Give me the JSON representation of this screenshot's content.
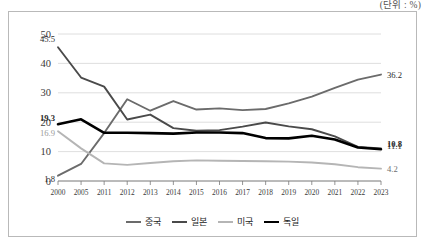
{
  "unit_note": "(단위 : %)",
  "legend": {
    "position": "bottom-center",
    "items": [
      {
        "label": "중국",
        "color": "#6b6b6b",
        "width": 2.2
      },
      {
        "label": "일본",
        "color": "#4a4a4a",
        "width": 2.2
      },
      {
        "label": "미국",
        "color": "#b5b5b5",
        "width": 2.2
      },
      {
        "label": "독일",
        "color": "#000000",
        "width": 2.8
      }
    ]
  },
  "chart_data": {
    "type": "line",
    "title": "",
    "subtitle": "",
    "xlabel": "",
    "ylabel": "",
    "unit": "%",
    "grid": true,
    "legend_position": "bottom-center",
    "ylim": [
      0,
      50
    ],
    "yticks": [
      "0",
      "10",
      "20",
      "30",
      "40",
      "50"
    ],
    "categories": [
      "2000",
      "2005",
      "2011",
      "2012",
      "2013",
      "2014",
      "2015",
      "2016",
      "2017",
      "2018",
      "2019",
      "2020",
      "2021",
      "2022",
      "2023"
    ],
    "series": [
      {
        "name": "중국",
        "color": "#6b6b6b",
        "start_label": "1.8",
        "end_label": "36.2",
        "values": [
          1.8,
          5.8,
          16.3,
          27.8,
          23.9,
          27.2,
          24.3,
          24.7,
          24.1,
          24.5,
          26.4,
          28.7,
          31.7,
          34.5,
          36.2
        ]
      },
      {
        "name": "일본",
        "color": "#4a4a4a",
        "start_label": "45.5",
        "end_label": "11.1",
        "values": [
          45.5,
          35.2,
          32.1,
          20.9,
          22.6,
          18.0,
          17.1,
          17.3,
          18.5,
          19.9,
          18.6,
          17.6,
          15.2,
          11.6,
          11.1
        ]
      },
      {
        "name": "미국",
        "color": "#b5b5b5",
        "start_label": "16.9",
        "end_label": "4.2",
        "values": [
          16.9,
          11.1,
          6.0,
          5.5,
          6.1,
          6.7,
          7.0,
          6.9,
          6.8,
          6.7,
          6.6,
          6.3,
          5.7,
          4.7,
          4.2
        ]
      },
      {
        "name": "독일",
        "color": "#000000",
        "start_label": "19.3",
        "end_label": "10.8",
        "values": [
          19.3,
          21.0,
          16.4,
          16.4,
          16.3,
          16.1,
          16.5,
          16.5,
          16.3,
          14.6,
          14.5,
          15.4,
          14.1,
          11.4,
          10.8
        ]
      }
    ]
  }
}
